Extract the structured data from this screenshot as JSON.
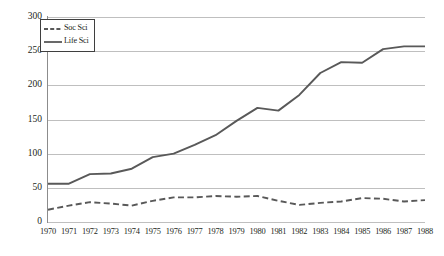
{
  "chart_data": {
    "type": "line",
    "title": "",
    "subtitle": "",
    "xlabel": "",
    "ylabel": "",
    "categories": [
      "1970",
      "1971",
      "1972",
      "1973",
      "1974",
      "1975",
      "1976",
      "1977",
      "1978",
      "1979",
      "1980",
      "1981",
      "1982",
      "1983",
      "1984",
      "1985",
      "1986",
      "1987",
      "1988"
    ],
    "x": [
      1970,
      1971,
      1972,
      1973,
      1974,
      1975,
      1976,
      1977,
      1978,
      1979,
      1980,
      1981,
      1982,
      1983,
      1984,
      1985,
      1986,
      1987,
      1988
    ],
    "series": [
      {
        "name": "Soc Sci",
        "style": "dashed",
        "color": "#595959",
        "values": [
          18,
          24,
          29,
          27,
          24,
          31,
          36,
          36,
          38,
          37,
          38,
          31,
          25,
          28,
          30,
          35,
          34,
          30,
          32
        ]
      },
      {
        "name": "Life Sci",
        "style": "solid",
        "color": "#595959",
        "values": [
          56,
          56,
          70,
          71,
          78,
          95,
          100,
          113,
          127,
          148,
          167,
          163,
          186,
          218,
          234,
          233,
          253,
          257,
          257
        ]
      }
    ],
    "ylim": [
      0,
      300
    ],
    "xlim": [
      1970,
      1988
    ],
    "yticks": [
      0,
      50,
      100,
      150,
      200,
      250,
      300
    ],
    "ytick_labels": [
      "0",
      "50",
      "100",
      "150",
      "200",
      "250",
      "300"
    ],
    "grid": true,
    "grid_axis": "y",
    "grid_color": "#bfbfbf",
    "axis_color": "#8c8c8c",
    "background": "#ffffff",
    "legend": {
      "position": "upper left",
      "border": true,
      "border_color": "#3f3f3f",
      "entries": [
        {
          "label": "Soc Sci",
          "style": "dashed",
          "color": "#595959"
        },
        {
          "label": "Life Sci",
          "style": "solid",
          "color": "#595959"
        }
      ]
    }
  }
}
